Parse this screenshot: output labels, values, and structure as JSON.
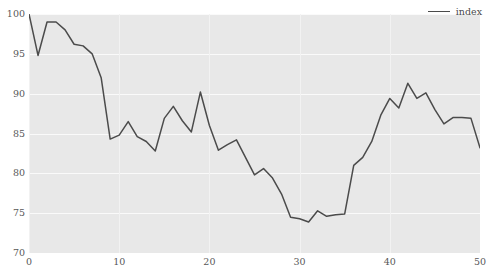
{
  "chart_data": {
    "type": "line",
    "title": "",
    "xlabel": "",
    "ylabel": "",
    "xlim": [
      0,
      50
    ],
    "ylim": [
      70,
      100
    ],
    "grid": true,
    "legend_position": "top-right",
    "xticks": [
      "0",
      "10",
      "20",
      "30",
      "40",
      "50"
    ],
    "xtick_values": [
      0,
      10,
      20,
      30,
      40,
      50
    ],
    "yticks": [
      "70",
      "75",
      "80",
      "85",
      "90",
      "95",
      "100"
    ],
    "ytick_values": [
      70,
      75,
      80,
      85,
      90,
      95,
      100
    ],
    "series": [
      {
        "name": "index",
        "color": "#4B4B4B",
        "x": [
          0,
          1,
          2,
          3,
          4,
          5,
          6,
          7,
          8,
          9,
          10,
          11,
          12,
          13,
          14,
          15,
          16,
          17,
          18,
          19,
          20,
          21,
          22,
          23,
          24,
          25,
          26,
          27,
          28,
          29,
          30,
          31,
          32,
          33,
          34,
          35,
          36,
          37,
          38,
          39,
          40,
          41,
          42,
          43,
          44,
          45,
          46,
          47,
          48,
          49,
          50
        ],
        "values": [
          100.0,
          94.8,
          99.0,
          99.0,
          98.0,
          96.2,
          96.0,
          95.0,
          92.0,
          84.3,
          84.8,
          86.5,
          84.6,
          84.0,
          82.8,
          86.9,
          88.4,
          86.6,
          85.2,
          90.2,
          86.0,
          82.9,
          83.6,
          84.2,
          82.0,
          79.8,
          80.6,
          79.4,
          77.4,
          74.5,
          74.3,
          73.9,
          75.3,
          74.6,
          74.8,
          74.9,
          81.0,
          82.0,
          84.0,
          87.3,
          89.4,
          88.2,
          91.3,
          89.4,
          90.1,
          88.0,
          86.2,
          87.0,
          87.0,
          86.9,
          83.2
        ]
      }
    ]
  },
  "legend": {
    "entries": [
      {
        "label": "index"
      }
    ]
  },
  "colors": {
    "plot_background": "#E8E8E8",
    "figure_background": "#FFFFFF",
    "gridline": "#FAFAFA",
    "line": "#4B4B4B",
    "tick_label": "#585858"
  }
}
